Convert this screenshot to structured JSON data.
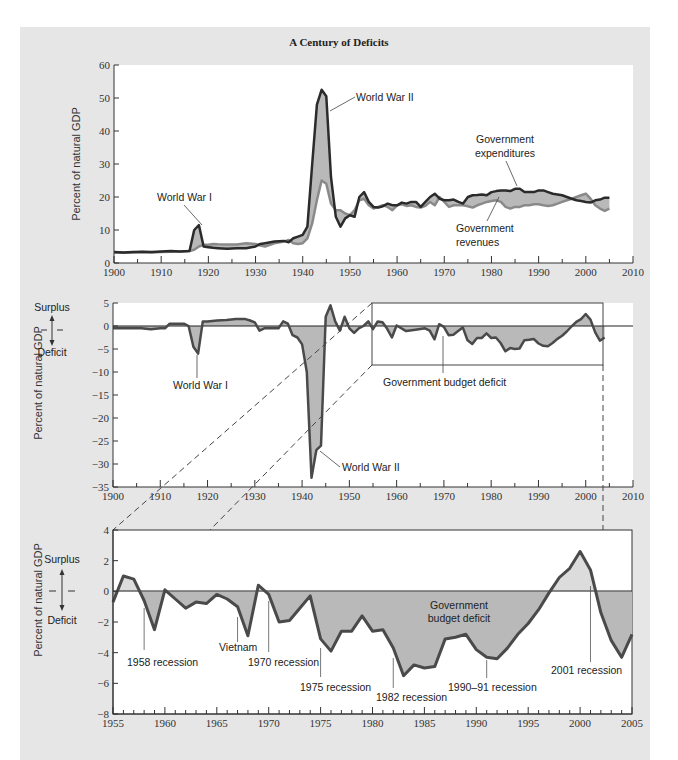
{
  "title": "A Century of Deficits",
  "colors": {
    "panel_bg": "#e6e6e6",
    "plot_bg": "#ffffff",
    "expenditures_line": "#2b2b2b",
    "revenues_line": "#8a8a8a",
    "deficit_fill": "#b9b9b9",
    "surplus_fill": "#dcdcdc",
    "deficit_line": "#4a4a4a"
  },
  "legend_labels": {
    "surplus": "Surplus",
    "deficit": "Deficit"
  },
  "chart_data": [
    {
      "id": "top",
      "type": "line",
      "title": "A Century of Deficits",
      "xlabel": "",
      "ylabel": "Percent of natural GDP",
      "xlim": [
        1900,
        2010
      ],
      "ylim": [
        0,
        60
      ],
      "xticks": [
        1900,
        1910,
        1920,
        1930,
        1940,
        1950,
        1960,
        1970,
        1980,
        1990,
        2000,
        2010
      ],
      "yticks": [
        0,
        10,
        20,
        30,
        40,
        50,
        60
      ],
      "grid": false,
      "fill_between": true,
      "annotations": [
        {
          "text": "World War I",
          "x": 1919,
          "y": 11
        },
        {
          "text": "World War II",
          "x": 1945,
          "y": 46
        },
        {
          "text": "Government expenditures",
          "x": 1985,
          "y": 22
        },
        {
          "text": "Government revenues",
          "x": 1981,
          "y": 18
        }
      ],
      "x": [
        1900,
        1902,
        1904,
        1906,
        1908,
        1910,
        1912,
        1914,
        1916,
        1917,
        1918,
        1919,
        1920,
        1921,
        1922,
        1924,
        1926,
        1928,
        1930,
        1931,
        1932,
        1934,
        1936,
        1937,
        1938,
        1939,
        1940,
        1941,
        1942,
        1943,
        1944,
        1945,
        1946,
        1947,
        1948,
        1949,
        1950,
        1951,
        1952,
        1953,
        1954,
        1955,
        1956,
        1957,
        1958,
        1959,
        1960,
        1961,
        1962,
        1963,
        1964,
        1965,
        1966,
        1967,
        1968,
        1969,
        1970,
        1971,
        1972,
        1973,
        1974,
        1975,
        1976,
        1977,
        1978,
        1979,
        1980,
        1981,
        1982,
        1983,
        1984,
        1985,
        1986,
        1987,
        1988,
        1989,
        1990,
        1991,
        1992,
        1993,
        1994,
        1995,
        1996,
        1997,
        1998,
        1999,
        2000,
        2001,
        2002,
        2003,
        2004,
        2005
      ],
      "series": [
        {
          "name": "Government expenditures",
          "values": [
            3.3,
            3.2,
            3.3,
            3.4,
            3.3,
            3.5,
            3.6,
            3.5,
            3.6,
            10.0,
            11.5,
            5.0,
            4.8,
            4.6,
            4.5,
            4.3,
            4.5,
            4.5,
            5.0,
            5.8,
            6.0,
            6.5,
            6.7,
            6.3,
            7.5,
            8.0,
            8.5,
            11.0,
            30.0,
            48.0,
            52.5,
            50.5,
            26.0,
            14.0,
            11.0,
            13.5,
            14.5,
            14.0,
            20.0,
            21.5,
            18.5,
            17.0,
            16.8,
            17.2,
            18.0,
            17.5,
            17.5,
            18.3,
            18.0,
            18.5,
            18.5,
            17.0,
            18.5,
            20.0,
            21.0,
            19.5,
            19.0,
            19.0,
            19.2,
            18.5,
            18.0,
            20.0,
            20.5,
            20.6,
            20.8,
            20.5,
            21.5,
            21.8,
            22.0,
            22.0,
            21.8,
            22.5,
            22.5,
            21.5,
            21.5,
            21.5,
            22.0,
            22.0,
            21.5,
            21.0,
            20.8,
            20.5,
            20.0,
            19.5,
            19.0,
            18.8,
            18.5,
            18.3,
            19.0,
            19.2,
            19.8,
            19.8
          ]
        },
        {
          "name": "Government revenues",
          "values": [
            3.2,
            3.1,
            3.2,
            3.3,
            3.2,
            3.3,
            3.4,
            3.5,
            3.6,
            4.0,
            5.0,
            5.5,
            5.5,
            5.8,
            5.7,
            5.6,
            5.6,
            6.0,
            5.8,
            5.3,
            5.0,
            6.0,
            6.5,
            7.0,
            6.0,
            5.8,
            6.0,
            7.5,
            12.0,
            19.0,
            25.0,
            24.0,
            18.0,
            16.0,
            16.0,
            15.0,
            14.5,
            16.0,
            19.0,
            19.5,
            17.5,
            16.5,
            17.0,
            17.5,
            17.0,
            16.0,
            17.5,
            17.8,
            17.3,
            17.5,
            17.0,
            16.8,
            17.3,
            18.5,
            17.5,
            20.0,
            18.5,
            17.0,
            17.5,
            17.5,
            17.5,
            17.2,
            16.8,
            17.5,
            18.0,
            18.5,
            18.8,
            19.0,
            18.5,
            17.0,
            16.5,
            17.0,
            17.0,
            17.5,
            17.5,
            17.8,
            17.8,
            17.5,
            17.3,
            17.5,
            18.0,
            18.5,
            19.0,
            19.5,
            20.0,
            20.5,
            21.0,
            19.5,
            17.5,
            16.5,
            15.8,
            16.5
          ]
        }
      ]
    },
    {
      "id": "middle",
      "type": "area",
      "title": "",
      "xlabel": "",
      "ylabel": "Percent of natural GDP",
      "xlim": [
        1900,
        2010
      ],
      "ylim": [
        -35,
        5
      ],
      "xticks": [
        1900,
        1910,
        1920,
        1930,
        1940,
        1950,
        1960,
        1970,
        1980,
        1990,
        2000,
        2010
      ],
      "yticks": [
        5,
        0,
        -5,
        -10,
        -15,
        -20,
        -25,
        -30,
        -35
      ],
      "grid": false,
      "zero_line": true,
      "zoom_box": {
        "x0": 1955,
        "x1": 2004,
        "y0": 5,
        "y1": -8
      },
      "annotations": [
        {
          "text": "World War I",
          "x": 1918,
          "y": -6
        },
        {
          "text": "World War II",
          "x": 1943,
          "y": -28
        },
        {
          "text": "Government budget deficit",
          "x": 1970,
          "y": -2
        }
      ],
      "series": [
        {
          "name": "Government budget deficit",
          "x": [
            1900,
            1902,
            1904,
            1906,
            1908,
            1910,
            1911,
            1912,
            1914,
            1915,
            1916,
            1917,
            1918,
            1919,
            1920,
            1922,
            1924,
            1926,
            1928,
            1929,
            1930,
            1931,
            1932,
            1934,
            1935,
            1936,
            1937,
            1938,
            1939,
            1940,
            1941,
            1942,
            1943,
            1944,
            1945,
            1946,
            1947,
            1948,
            1949,
            1950,
            1951,
            1952,
            1953,
            1954,
            1955,
            1956,
            1957,
            1958,
            1959,
            1960,
            1962,
            1964,
            1966,
            1967,
            1968,
            1969,
            1970,
            1971,
            1972,
            1973,
            1974,
            1975,
            1976,
            1977,
            1978,
            1979,
            1980,
            1981,
            1982,
            1983,
            1984,
            1985,
            1986,
            1987,
            1988,
            1989,
            1990,
            1991,
            1992,
            1993,
            1994,
            1995,
            1996,
            1997,
            1998,
            1999,
            2000,
            2001,
            2002,
            2003,
            2004
          ],
          "values": [
            -0.5,
            -0.5,
            -0.5,
            -0.5,
            -0.7,
            -0.5,
            -0.5,
            0.5,
            0.5,
            0.5,
            0.0,
            -4.5,
            -6.0,
            1.0,
            1.0,
            1.2,
            1.3,
            1.5,
            1.5,
            1.2,
            0.8,
            -1.0,
            -0.5,
            -0.5,
            -0.5,
            1.0,
            0.5,
            -2.0,
            -2.5,
            -4.0,
            -10.0,
            -33.0,
            -27.0,
            -26.0,
            2.0,
            4.5,
            1.0,
            -1.0,
            2.0,
            -0.5,
            -1.5,
            -0.5,
            0.0,
            1.0,
            -0.7,
            1.0,
            0.8,
            -0.6,
            -2.5,
            0.1,
            -1.1,
            -0.8,
            -0.5,
            -1.0,
            -2.9,
            0.4,
            -0.2,
            -2.0,
            -1.9,
            -1.1,
            -0.3,
            -3.1,
            -3.9,
            -2.6,
            -2.6,
            -1.6,
            -2.6,
            -2.5,
            -3.7,
            -5.5,
            -4.8,
            -5.0,
            -4.9,
            -3.1,
            -3.0,
            -2.8,
            -3.8,
            -4.3,
            -4.4,
            -3.7,
            -2.8,
            -2.1,
            -1.2,
            -0.1,
            0.9,
            1.5,
            2.6,
            1.4,
            -1.4,
            -3.2,
            -2.5
          ]
        }
      ]
    },
    {
      "id": "bottom",
      "type": "area",
      "title": "",
      "xlabel": "",
      "ylabel": "Percent of natural GDP",
      "xlim": [
        1955,
        2005
      ],
      "ylim": [
        -8,
        4
      ],
      "xticks": [
        1955,
        1960,
        1965,
        1970,
        1975,
        1980,
        1985,
        1990,
        1995,
        2000,
        2005
      ],
      "yticks": [
        4,
        2,
        0,
        -2,
        -4,
        -6,
        -8
      ],
      "grid": false,
      "zero_line": true,
      "annotations": [
        {
          "text": "1958 recession",
          "x": 1958,
          "y": -4.6
        },
        {
          "text": "Vietnam",
          "x": 1967,
          "y": -3.7
        },
        {
          "text": "1970 recession",
          "x": 1970,
          "y": -4.6
        },
        {
          "text": "1975 recession",
          "x": 1975,
          "y": -6.2
        },
        {
          "text": "1982 recession",
          "x": 1982,
          "y": -6.9
        },
        {
          "text": "1990–91 recession",
          "x": 1991,
          "y": -6.2
        },
        {
          "text": "2001 recession",
          "x": 2001,
          "y": -5.1
        },
        {
          "text": "Government budget deficit",
          "x": 1986,
          "y": -1
        }
      ],
      "series": [
        {
          "name": "Government budget deficit",
          "x": [
            1955,
            1956,
            1957,
            1958,
            1959,
            1960,
            1961,
            1962,
            1963,
            1964,
            1965,
            1966,
            1967,
            1968,
            1969,
            1970,
            1971,
            1972,
            1973,
            1974,
            1975,
            1976,
            1977,
            1978,
            1979,
            1980,
            1981,
            1982,
            1983,
            1984,
            1985,
            1986,
            1987,
            1988,
            1989,
            1990,
            1991,
            1992,
            1993,
            1994,
            1995,
            1996,
            1997,
            1998,
            1999,
            2000,
            2001,
            2002,
            2003,
            2004,
            2005
          ],
          "values": [
            -0.7,
            1.0,
            0.8,
            -0.6,
            -2.5,
            0.1,
            -0.5,
            -1.1,
            -0.7,
            -0.8,
            -0.2,
            -0.5,
            -1.0,
            -2.9,
            0.4,
            -0.2,
            -2.0,
            -1.9,
            -1.1,
            -0.3,
            -3.1,
            -3.9,
            -2.6,
            -2.6,
            -1.6,
            -2.6,
            -2.5,
            -3.7,
            -5.5,
            -4.8,
            -5.0,
            -4.9,
            -3.1,
            -3.0,
            -2.8,
            -3.8,
            -4.3,
            -4.4,
            -3.7,
            -2.8,
            -2.1,
            -1.2,
            -0.1,
            0.9,
            1.5,
            2.6,
            1.4,
            -1.4,
            -3.2,
            -4.3,
            -2.8
          ]
        }
      ]
    }
  ]
}
